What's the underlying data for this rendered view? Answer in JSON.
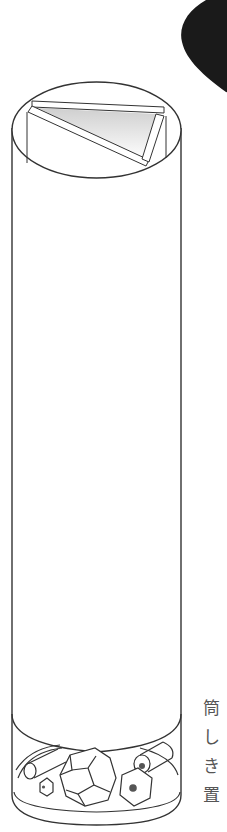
{
  "figure": {
    "parts": {
      "top": "three mirrors arranged in a triangular prism viewed through the top opening",
      "body": "tall cylindrical tube",
      "bottom": "object chamber containing beads, a faceted gem, hexagonal nuts and rods"
    },
    "colors": {
      "line": "#333333",
      "blob": "#1a1a1a",
      "mirror_gradient_start": "#d8d8d8",
      "mirror_gradient_end": "#ffffff",
      "dot": "#555555"
    }
  },
  "caption": {
    "chars": [
      "筒",
      "し",
      "き",
      "置"
    ]
  }
}
